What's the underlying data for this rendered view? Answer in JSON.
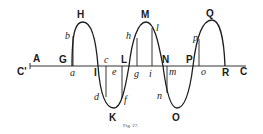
{
  "figure": {
    "caption": "Fig. 27.",
    "axis": {
      "left_label": "C'",
      "right_label": "C"
    },
    "points_upper": [
      {
        "key": "A",
        "label": "A"
      },
      {
        "key": "G",
        "label": "G"
      },
      {
        "key": "H",
        "label": "H"
      },
      {
        "key": "I",
        "label": "I"
      },
      {
        "key": "L",
        "label": "L"
      },
      {
        "key": "K",
        "label": "K"
      },
      {
        "key": "M",
        "label": "M"
      },
      {
        "key": "N",
        "label": "N"
      },
      {
        "key": "O",
        "label": "O"
      },
      {
        "key": "P",
        "label": "P"
      },
      {
        "key": "Q",
        "label": "Q"
      },
      {
        "key": "R",
        "label": "R"
      }
    ],
    "points_italic": {
      "a": "a",
      "b": "b",
      "c": "c",
      "d": "d",
      "e": "e",
      "f": "f",
      "g": "g",
      "h": "h",
      "i": "i",
      "l": "l",
      "m": "m",
      "n": "n",
      "o": "o",
      "p": "p"
    },
    "colors": {
      "ink": "#1e1e1e",
      "background": "#ffffff"
    }
  }
}
